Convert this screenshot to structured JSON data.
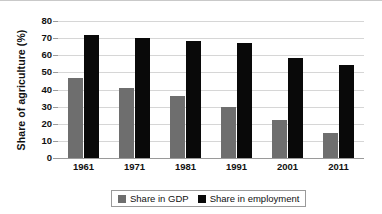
{
  "chart_data": {
    "type": "bar",
    "title": "",
    "xlabel": "",
    "ylabel": "Share of agriculture (%)",
    "categories": [
      "1961",
      "1971",
      "1981",
      "1991",
      "2001",
      "2011"
    ],
    "series": [
      {
        "name": "Share in GDP",
        "color": "#6e6e6e",
        "values": [
          47,
          41,
          36,
          30,
          22,
          14.5
        ]
      },
      {
        "name": "Share in employment",
        "color": "#090909",
        "values": [
          72,
          70,
          68.5,
          67,
          58.5,
          54.5
        ]
      }
    ],
    "ylim": [
      0,
      80
    ],
    "yticks": [
      0,
      10,
      20,
      30,
      40,
      50,
      60,
      70,
      80
    ],
    "ytick_labels": [
      "0",
      "10",
      "20",
      "30",
      "40",
      "50",
      "60",
      "70",
      "80"
    ],
    "grid": true,
    "legend_position": "bottom"
  },
  "legend": {
    "items": [
      {
        "label": "Share in GDP",
        "swatch": "gray-square-swatch"
      },
      {
        "label": "Share in employment",
        "swatch": "black-square-swatch"
      }
    ]
  }
}
